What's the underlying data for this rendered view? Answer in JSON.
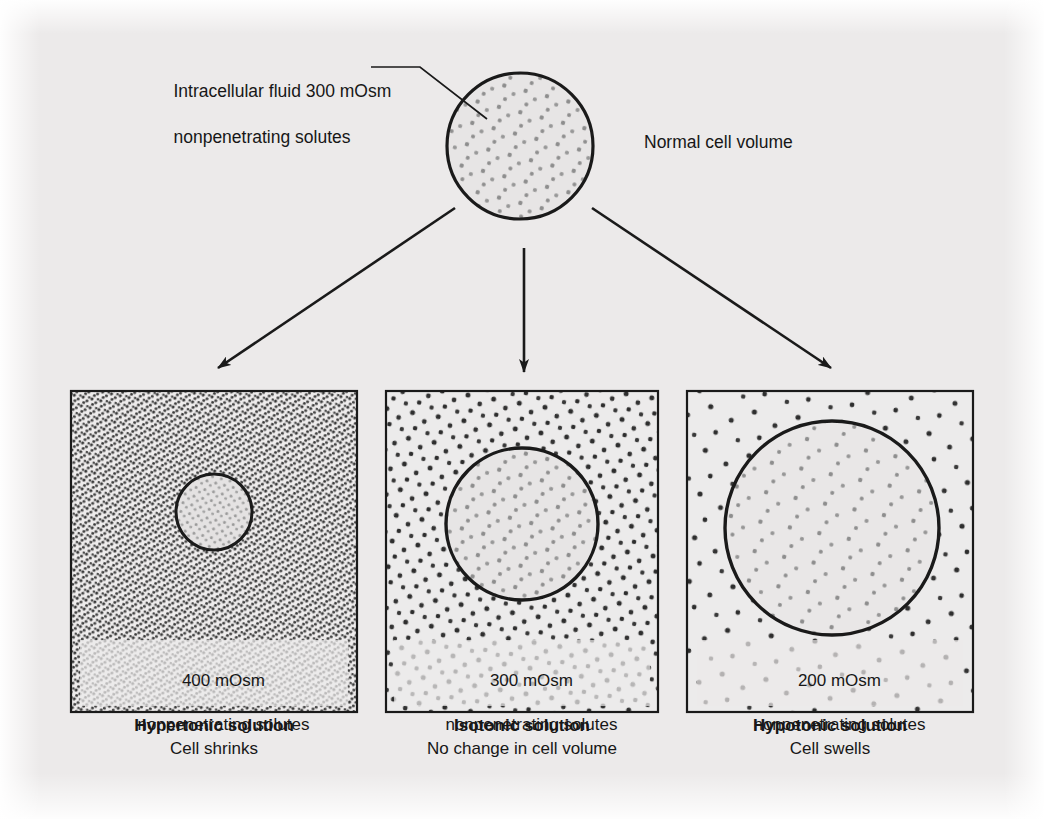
{
  "figure": {
    "title_semantic": "Effect of extracellular osmolarity on cell volume",
    "background_color": "#eceaea",
    "ink_color": "#1a1a1a"
  },
  "top_cell": {
    "label_line1": "Intracellular fluid 300 mOsm",
    "label_line2": "nonpenetrating solutes",
    "volume_label": "Normal cell volume",
    "osmolarity": "300 mOsm",
    "radius_px": 73,
    "center": {
      "x": 520,
      "y": 146
    }
  },
  "arrows": [
    {
      "name": "arrow-to-hypertonic",
      "direction": "down-left"
    },
    {
      "name": "arrow-to-isotonic",
      "direction": "down"
    },
    {
      "name": "arrow-to-hypotonic",
      "direction": "down-right"
    }
  ],
  "panels": [
    {
      "id": "hypertonic",
      "box_line1": "400 mOsm",
      "box_line2": "nonpenetrating solutes",
      "caption_title": "Hypertonic solution",
      "caption_subtitle": "Cell shrinks",
      "osmolarity_value": 400,
      "solute_density": "high",
      "cell_radius_px": 38,
      "cell_state": "shrunken"
    },
    {
      "id": "isotonic",
      "box_line1": "300 mOsm",
      "box_line2": "nonpenetrating solutes",
      "caption_title": "Isotonic solution",
      "caption_subtitle": "No change in cell volume",
      "osmolarity_value": 300,
      "solute_density": "medium",
      "cell_radius_px": 76,
      "cell_state": "normal"
    },
    {
      "id": "hypotonic",
      "box_line1": "200 mOsm",
      "box_line2": "nonpenetrating solutes",
      "caption_title": "Hypotonic solution",
      "caption_subtitle": "Cell swells",
      "osmolarity_value": 200,
      "solute_density": "low",
      "cell_radius_px": 107,
      "cell_state": "swollen"
    }
  ]
}
